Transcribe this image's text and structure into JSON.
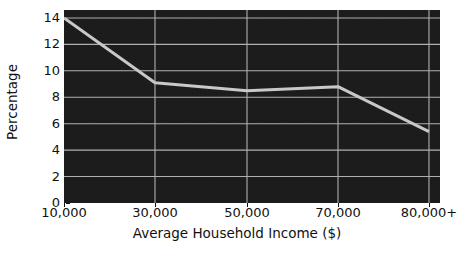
{
  "chart_data": {
    "type": "line",
    "title": "",
    "subtitle": "",
    "xlabel": "Average Household Income ($)",
    "ylabel": "Percentage",
    "categories": [
      "10,000",
      "30,000",
      "50,000",
      "70,000",
      "80,000+"
    ],
    "values": [
      14.0,
      9.1,
      8.5,
      8.8,
      5.4
    ],
    "series": [
      {
        "name": "Percentage",
        "values": [
          14.0,
          9.1,
          8.5,
          8.8,
          5.4
        ],
        "color": "#c8c8c8",
        "line_width": 3,
        "markers": false
      }
    ],
    "ylim": [
      0,
      14.6
    ],
    "yticks": [
      0,
      2,
      4,
      6,
      8,
      10,
      12,
      14
    ],
    "ytick_labels": [
      "0",
      "2",
      "4",
      "6",
      "8",
      "10",
      "12",
      "14"
    ],
    "xtick_labels": [
      "10,000",
      "30,000",
      "50,000",
      "70,000",
      "80,000+"
    ],
    "grid": true,
    "grid_axis": "both",
    "grid_color": "#b0b0b0",
    "legend": false,
    "legend_position": "none",
    "plot_background": "#191919",
    "figure_background": "#ffffff",
    "text_color": "#111111",
    "annotations": []
  },
  "axes": {
    "y": {
      "label": "Percentage",
      "ticks": [
        "0",
        "2",
        "4",
        "6",
        "8",
        "10",
        "12",
        "14"
      ]
    },
    "x": {
      "label": "Average Household Income ($)",
      "ticks": [
        "10,000",
        "30,000",
        "50,000",
        "70,000",
        "80,000+"
      ]
    }
  }
}
